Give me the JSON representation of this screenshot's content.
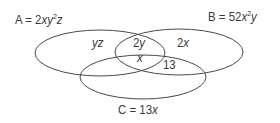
{
  "diagram": {
    "type": "venn",
    "stroke_color": "#4a4a4a",
    "text_color": "#3a3a3a",
    "sets": [
      {
        "id": "A",
        "name": "A",
        "expr_pre": "2xy",
        "expr_sup": "2",
        "expr_post": "z",
        "full": "A = 2xy²z"
      },
      {
        "id": "B",
        "name": "B",
        "expr_pre": "52x",
        "expr_sup": "2",
        "expr_post": "y",
        "full": "B = 52x²y"
      },
      {
        "id": "C",
        "name": "C",
        "expr_pre": "13x",
        "full": "C = 13x"
      }
    ],
    "regions": {
      "A_only": "yz",
      "A_and_B_only": "2y",
      "A_and_B_and_C": "x",
      "B_only": "2x",
      "B_and_C_only": "13"
    },
    "equals": "="
  }
}
